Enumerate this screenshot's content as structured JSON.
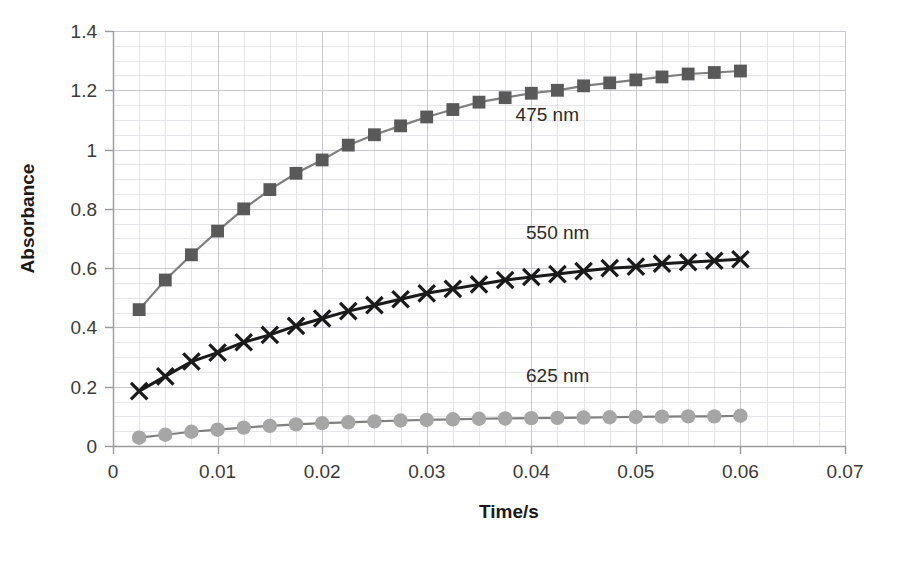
{
  "chart_data": {
    "type": "line",
    "title": "",
    "xlabel": "Time/s",
    "ylabel": "Absorbance",
    "xlim": [
      0,
      0.07
    ],
    "ylim": [
      0,
      1.4
    ],
    "xticks": [
      "0",
      "0.01",
      "0.02",
      "0.03",
      "0.04",
      "0.05",
      "0.06",
      "0.07"
    ],
    "xtick_values": [
      0,
      0.01,
      0.02,
      0.03,
      0.04,
      0.05,
      0.06,
      0.07
    ],
    "yticks": [
      "0",
      "0.2",
      "0.4",
      "0.6",
      "0.8",
      "1",
      "1.2",
      "1.4"
    ],
    "ytick_values": [
      0,
      0.2,
      0.4,
      0.6,
      0.8,
      1.0,
      1.2,
      1.4
    ],
    "grid": true,
    "grid_minor_x": 0.0025,
    "grid_minor_y": 0.05,
    "legend_position": "inline-annotations",
    "x": [
      0.0025,
      0.005,
      0.0075,
      0.01,
      0.0125,
      0.015,
      0.0175,
      0.02,
      0.0225,
      0.025,
      0.0275,
      0.03,
      0.0325,
      0.035,
      0.0375,
      0.04,
      0.0425,
      0.045,
      0.0475,
      0.05,
      0.0525,
      0.055,
      0.0575,
      0.06
    ],
    "series": [
      {
        "name": "475 nm",
        "marker": "square",
        "color": "#595959",
        "line_color": "#7f7f7f",
        "values": [
          0.46,
          0.56,
          0.645,
          0.725,
          0.8,
          0.865,
          0.92,
          0.965,
          1.015,
          1.05,
          1.08,
          1.11,
          1.135,
          1.16,
          1.175,
          1.19,
          1.2,
          1.215,
          1.225,
          1.235,
          1.245,
          1.255,
          1.26,
          1.265
        ]
      },
      {
        "name": "550 nm",
        "marker": "x",
        "color": "#1a1a1a",
        "line_color": "#1a1a1a",
        "values": [
          0.185,
          0.235,
          0.285,
          0.315,
          0.35,
          0.375,
          0.405,
          0.43,
          0.455,
          0.475,
          0.495,
          0.515,
          0.53,
          0.545,
          0.56,
          0.57,
          0.58,
          0.59,
          0.6,
          0.605,
          0.615,
          0.62,
          0.625,
          0.63
        ]
      },
      {
        "name": "625 nm",
        "marker": "circle",
        "color": "#a6a6a6",
        "line_color": "#808080",
        "values": [
          0.028,
          0.038,
          0.048,
          0.055,
          0.062,
          0.068,
          0.073,
          0.077,
          0.08,
          0.083,
          0.086,
          0.088,
          0.09,
          0.092,
          0.093,
          0.094,
          0.095,
          0.096,
          0.097,
          0.098,
          0.099,
          0.1,
          0.1,
          0.102
        ]
      }
    ],
    "annotations": [
      {
        "text": "475 nm",
        "x": 0.0385,
        "y": 1.095
      },
      {
        "text": "550 nm",
        "x": 0.0395,
        "y": 0.7
      },
      {
        "text": "625 nm",
        "x": 0.0395,
        "y": 0.215
      }
    ]
  },
  "colors": {
    "background": "#ffffff",
    "axis": "#9a9a9a",
    "grid_major": "#c9c9cf",
    "grid_minor": "#e6e6ea",
    "text": "#1a1a1a",
    "series_475": "#595959",
    "series_550": "#1a1a1a",
    "series_625": "#a6a6a6"
  },
  "footer": {
    "cut_text": ""
  }
}
